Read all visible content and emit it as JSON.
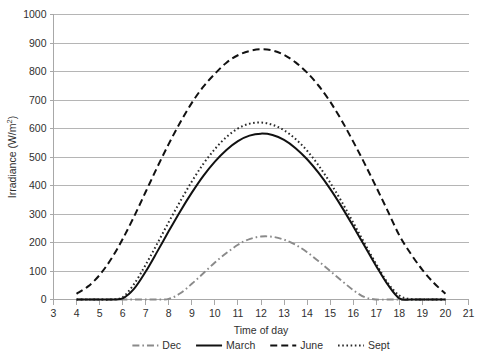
{
  "chart_data": {
    "type": "line",
    "title": "",
    "xlabel": "Time of day",
    "ylabel": "Irradiance (W/m2)",
    "ylabel_display": "Irradiance (W/m²)",
    "xlim": [
      3,
      21
    ],
    "ylim": [
      0,
      1000
    ],
    "xticks": [
      3,
      4,
      5,
      6,
      7,
      8,
      9,
      10,
      11,
      12,
      13,
      14,
      15,
      16,
      17,
      18,
      19,
      20,
      21
    ],
    "yticks": [
      0,
      100,
      200,
      300,
      400,
      500,
      600,
      700,
      800,
      900,
      1000
    ],
    "xtick_labels": [
      "3",
      "4",
      "5",
      "6",
      "7",
      "8",
      "9",
      "10",
      "11",
      "12",
      "13",
      "14",
      "15",
      "16",
      "17",
      "18",
      "19",
      "20",
      "21"
    ],
    "ytick_labels": [
      "0",
      "100",
      "200",
      "300",
      "400",
      "500",
      "600",
      "700",
      "800",
      "900",
      "1000"
    ],
    "grid": "horizontal",
    "legend_position": "bottom",
    "x": [
      4,
      4.5,
      5,
      5.5,
      6,
      6.5,
      7,
      7.5,
      8,
      8.5,
      9,
      9.5,
      10,
      10.5,
      11,
      11.5,
      12,
      12.5,
      13,
      13.5,
      14,
      14.5,
      15,
      15.5,
      16,
      16.5,
      17,
      17.5,
      18,
      18.5,
      19,
      19.5,
      20
    ],
    "series": [
      {
        "name": "Dec",
        "style": "dashdot",
        "color": "#8a8a8a",
        "values": [
          0,
          0,
          0,
          0,
          0,
          0,
          0,
          0,
          2,
          22,
          55,
          92,
          130,
          163,
          192,
          212,
          221,
          220,
          210,
          192,
          166,
          134,
          100,
          66,
          33,
          8,
          0,
          0,
          0,
          0,
          0,
          0,
          0
        ]
      },
      {
        "name": "March",
        "style": "solid",
        "color": "#111111",
        "values": [
          0,
          0,
          0,
          0,
          4,
          38,
          98,
          168,
          240,
          310,
          375,
          434,
          484,
          525,
          556,
          575,
          582,
          577,
          560,
          531,
          492,
          444,
          388,
          325,
          257,
          187,
          117,
          52,
          4,
          0,
          0,
          0,
          0
        ]
      },
      {
        "name": "June",
        "style": "dashed",
        "color": "#111111",
        "values": [
          20,
          46,
          86,
          142,
          212,
          292,
          378,
          464,
          546,
          622,
          690,
          747,
          792,
          831,
          857,
          872,
          878,
          874,
          858,
          832,
          796,
          750,
          694,
          628,
          554,
          476,
          394,
          310,
          225,
          160,
          104,
          58,
          20
        ]
      },
      {
        "name": "Sept",
        "style": "dotted",
        "color": "#2a2a2a",
        "values": [
          0,
          0,
          0,
          0,
          8,
          55,
          122,
          196,
          272,
          345,
          414,
          476,
          528,
          570,
          600,
          617,
          621,
          613,
          594,
          563,
          522,
          470,
          410,
          343,
          270,
          196,
          124,
          58,
          14,
          1,
          0,
          0,
          0
        ]
      }
    ]
  },
  "legend": {
    "items": [
      {
        "label": "Dec"
      },
      {
        "label": "March"
      },
      {
        "label": "June"
      },
      {
        "label": "Sept"
      }
    ]
  }
}
